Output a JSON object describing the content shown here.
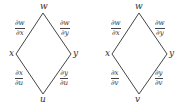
{
  "diagrams": [
    {
      "nodes": {
        "top": "w",
        "left": "x",
        "right": "y",
        "bottom": "u"
      },
      "edges": {
        "top_left": {
          "num": "∂w",
          "den": "∂x"
        },
        "top_right": {
          "num": "∂w",
          "den": "∂y"
        },
        "bottom_left": {
          "num": "∂x",
          "den": "∂u"
        },
        "bottom_right": {
          "num": "∂y",
          "den": "∂u"
        }
      }
    },
    {
      "nodes": {
        "top": "w",
        "left": "x",
        "right": "y",
        "bottom": "v"
      },
      "edges": {
        "top_left": {
          "num": "∂w",
          "den": "∂x"
        },
        "top_right": {
          "num": "∂w",
          "den": "∂y"
        },
        "bottom_left": {
          "num": "∂x",
          "den": "∂v"
        },
        "bottom_right": {
          "num": "∂y",
          "den": "∂v"
        }
      }
    }
  ]
}
